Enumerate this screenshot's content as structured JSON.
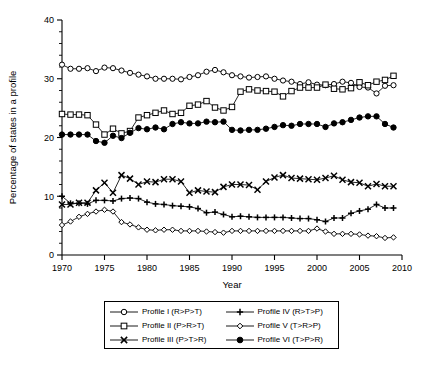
{
  "chart_data": {
    "type": "line",
    "title": "",
    "xlabel": "Year",
    "ylabel": "Percentage of states in a profile",
    "xlim": [
      1970,
      2010
    ],
    "ylim": [
      0,
      40
    ],
    "xticks": [
      1970,
      1975,
      1980,
      1985,
      1990,
      1995,
      2000,
      2005,
      2010
    ],
    "yticks": [
      0,
      10,
      20,
      30,
      40
    ],
    "xtick_labels": [
      "1970",
      "1975",
      "1980",
      "1985",
      "1990",
      "1995",
      "2000",
      "2005",
      "2010"
    ],
    "ytick_labels": [
      "0",
      "10",
      "20",
      "30",
      "40"
    ],
    "x_minor_step": 1,
    "y_minor_step": 2,
    "grid": false,
    "legend_position": "below",
    "x": [
      1970,
      1971,
      1972,
      1973,
      1974,
      1975,
      1976,
      1977,
      1978,
      1979,
      1980,
      1981,
      1982,
      1983,
      1984,
      1985,
      1986,
      1987,
      1988,
      1989,
      1990,
      1991,
      1992,
      1993,
      1994,
      1995,
      1996,
      1997,
      1998,
      1999,
      2000,
      2001,
      2002,
      2003,
      2004,
      2005,
      2006,
      2007,
      2008,
      2009
    ],
    "series": [
      {
        "name": "Profile I (R>P>T)",
        "marker": "open-circle",
        "values": [
          32.4,
          31.7,
          31.7,
          31.8,
          31.3,
          31.9,
          31.8,
          31.4,
          31.0,
          30.7,
          30.4,
          30.0,
          30.0,
          30.0,
          29.9,
          30.3,
          30.6,
          31.2,
          31.5,
          31.1,
          30.6,
          30.4,
          30.2,
          30.3,
          30.4,
          30.0,
          29.7,
          29.5,
          29.1,
          29.4,
          29.0,
          28.9,
          29.1,
          29.5,
          29.3,
          28.6,
          28.5,
          27.5,
          28.8,
          28.9
        ]
      },
      {
        "name": "Profile II (P>R>T)",
        "marker": "open-square",
        "values": [
          24.0,
          23.9,
          23.9,
          23.8,
          22.2,
          20.5,
          21.5,
          20.7,
          21.1,
          23.4,
          23.8,
          24.2,
          24.6,
          24.0,
          24.2,
          25.4,
          25.6,
          26.2,
          25.1,
          24.6,
          25.2,
          27.8,
          28.2,
          28.0,
          27.9,
          27.8,
          27.0,
          27.9,
          28.5,
          28.5,
          28.5,
          29.0,
          28.3,
          28.2,
          28.4,
          29.4,
          28.9,
          29.5,
          29.8,
          30.5
        ]
      },
      {
        "name": "Profile III (P>T>R)",
        "marker": "x",
        "values": [
          8.6,
          8.6,
          8.9,
          8.9,
          11.0,
          12.3,
          10.6,
          13.6,
          13.0,
          12.0,
          12.5,
          12.4,
          12.9,
          12.9,
          12.5,
          10.6,
          11.0,
          10.8,
          10.7,
          11.6,
          12.0,
          12.0,
          11.9,
          11.1,
          12.5,
          13.2,
          13.6,
          13.1,
          13.0,
          12.9,
          12.8,
          13.1,
          13.5,
          12.8,
          12.4,
          12.3,
          11.7,
          12.1,
          11.7,
          11.7
        ]
      },
      {
        "name": "Profile IV (R>T>P)",
        "marker": "plus",
        "values": [
          10.0,
          8.8,
          8.8,
          8.7,
          9.3,
          9.3,
          9.2,
          9.6,
          9.7,
          9.6,
          9.0,
          8.7,
          8.6,
          8.4,
          8.3,
          8.2,
          7.9,
          7.2,
          7.3,
          6.9,
          6.5,
          6.6,
          6.5,
          6.4,
          6.4,
          6.4,
          6.4,
          6.3,
          6.2,
          6.2,
          6.0,
          5.7,
          6.3,
          6.3,
          7.1,
          7.5,
          7.8,
          8.6,
          8.0,
          8.0
        ]
      },
      {
        "name": "Profile V (T>R>P)",
        "marker": "open-diamond",
        "values": [
          5.1,
          5.7,
          6.5,
          7.0,
          7.4,
          7.7,
          7.4,
          5.6,
          5.2,
          4.7,
          4.3,
          4.2,
          4.3,
          4.3,
          4.1,
          4.1,
          4.1,
          4.0,
          3.9,
          3.8,
          4.1,
          4.1,
          4.1,
          4.1,
          4.1,
          4.1,
          4.1,
          4.1,
          4.1,
          4.1,
          4.5,
          4.0,
          3.6,
          3.6,
          3.6,
          3.5,
          3.3,
          3.2,
          2.9,
          3.0
        ]
      },
      {
        "name": "Profile VI (T>P>R)",
        "marker": "filled-circle",
        "values": [
          20.5,
          20.5,
          20.5,
          20.5,
          19.4,
          19.1,
          20.3,
          19.9,
          20.8,
          21.6,
          21.4,
          21.7,
          21.4,
          22.3,
          22.6,
          22.4,
          22.4,
          22.7,
          22.6,
          22.7,
          21.3,
          21.2,
          21.3,
          21.3,
          21.5,
          21.8,
          22.1,
          22.0,
          22.3,
          22.3,
          22.3,
          21.8,
          22.4,
          22.6,
          23.0,
          23.4,
          23.6,
          23.6,
          22.3,
          21.7
        ]
      }
    ]
  },
  "legend": {
    "items": [
      {
        "label": "Profile I (R>P>T)",
        "marker": "open-circle"
      },
      {
        "label": "Profile IV (R>T>P)",
        "marker": "plus"
      },
      {
        "label": "Profile II (P>R>T)",
        "marker": "open-square"
      },
      {
        "label": "Profile V (T>R>P)",
        "marker": "open-diamond"
      },
      {
        "label": "Profile III (P>T>R)",
        "marker": "x"
      },
      {
        "label": "Profile VI (T>P>R)",
        "marker": "filled-circle"
      }
    ]
  },
  "colors": {
    "line": "#000000",
    "axis": "#000000",
    "background": "#ffffff"
  }
}
